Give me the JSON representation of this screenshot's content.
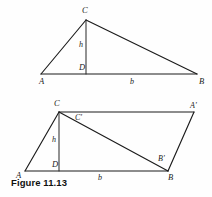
{
  "figure": {
    "caption": "Figure 11.13",
    "stroke_color": "#1b1b1b",
    "background_color": "#fefefe",
    "label_color": "#1b1b1b"
  },
  "top_diagram": {
    "name": "triangle-with-altitude",
    "vertices": {
      "A": {
        "label": "A",
        "x": 41,
        "y": 74,
        "label_x": 39,
        "label_y": 84
      },
      "B": {
        "label": "B",
        "x": 197,
        "y": 74,
        "label_x": 199,
        "label_y": 84
      },
      "C": {
        "label": "C",
        "x": 86,
        "y": 20,
        "label_x": 82,
        "label_y": 13
      },
      "D": {
        "label": "D",
        "x": 86,
        "y": 74,
        "label_x": 79,
        "label_y": 70
      }
    },
    "measures": {
      "height": {
        "label": "h",
        "x": 79,
        "y": 47
      },
      "base": {
        "label": "b",
        "x": 130,
        "y": 84
      }
    }
  },
  "bottom_diagram": {
    "name": "parallelogram-with-diagonal",
    "vertices": {
      "A": {
        "label": "A",
        "x": 25,
        "y": 171,
        "label_x": 16,
        "label_y": 178
      },
      "B": {
        "label": "B",
        "x": 168,
        "y": 171,
        "label_x": 168,
        "label_y": 180
      },
      "C": {
        "label": "C",
        "x": 59,
        "y": 112,
        "label_x": 54,
        "label_y": 106
      },
      "D": {
        "label": "D",
        "x": 59,
        "y": 171,
        "label_x": 52,
        "label_y": 167
      },
      "A_prime": {
        "label": "A'",
        "x": 194,
        "y": 112,
        "label_x": 190,
        "label_y": 108
      },
      "B_prime": {
        "label": "B'",
        "x": 163,
        "y": 163,
        "label_x": 158,
        "label_y": 161
      },
      "C_prime": {
        "label": "C'",
        "x": 81,
        "y": 121,
        "label_x": 75,
        "label_y": 120
      }
    },
    "measures": {
      "height": {
        "label": "h",
        "x": 52,
        "y": 142
      },
      "base": {
        "label": "b",
        "x": 98,
        "y": 180
      }
    }
  }
}
